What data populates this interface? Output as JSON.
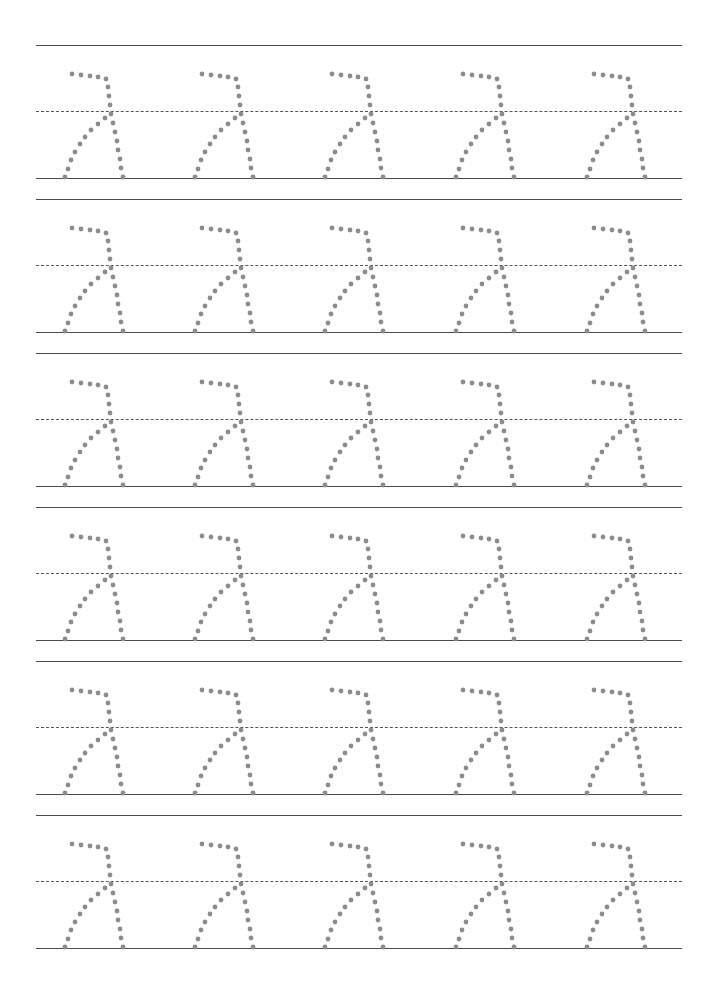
{
  "worksheet": {
    "type": "handwriting-tracing",
    "character": "λ",
    "rows": 6,
    "columns": 5,
    "dot_color": "#8c8c8c",
    "line_color": "#4a4a4a",
    "rows_layout": [
      {
        "top": 45,
        "mid": 111,
        "base": 178
      },
      {
        "top": 199,
        "mid": 265,
        "base": 332
      },
      {
        "top": 353,
        "mid": 419,
        "base": 486
      },
      {
        "top": 507,
        "mid": 573,
        "base": 640
      },
      {
        "top": 661,
        "mid": 727,
        "base": 794
      },
      {
        "top": 815,
        "mid": 881,
        "base": 948
      }
    ],
    "column_x": [
      58,
      188,
      318,
      449,
      580
    ]
  }
}
